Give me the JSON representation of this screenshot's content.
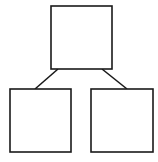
{
  "diagram": {
    "type": "tree",
    "stroke_color": "#1a1a1a",
    "fill_color": "#ffffff",
    "stroke_width": 1.6,
    "nodes": [
      {
        "id": "root",
        "label": "",
        "x": 51,
        "y": 6,
        "w": 61,
        "h": 63
      },
      {
        "id": "left-child",
        "label": "",
        "x": 10,
        "y": 89,
        "w": 61,
        "h": 63
      },
      {
        "id": "right-child",
        "label": "",
        "x": 91,
        "y": 89,
        "w": 62,
        "h": 63
      }
    ],
    "edges": [
      {
        "from": "root",
        "to": "left-child",
        "x1": 58,
        "y1": 69,
        "x2": 35,
        "y2": 89
      },
      {
        "from": "root",
        "to": "right-child",
        "x1": 102,
        "y1": 69,
        "x2": 127,
        "y2": 89
      }
    ]
  }
}
